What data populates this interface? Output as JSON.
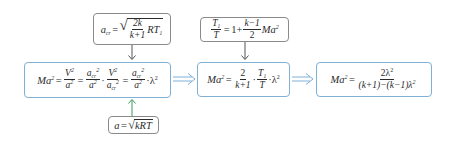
{
  "diagram": {
    "colors": {
      "main_border": "#7fb0d6",
      "side_border": "#8a8a8a",
      "down_arrow": "#555555",
      "up_arrow": "#3a9a5a",
      "implies_arrow": "#7fb0d6"
    },
    "nodes": {
      "acr_def": {
        "lhs": "a",
        "lhs_sub": "cr",
        "eq": "=",
        "sqrt_num": "2k",
        "sqrt_den": "k+1",
        "tail": "RT",
        "tail_sub": "1"
      },
      "temp_ratio": {
        "frac_num": "T",
        "frac_num_sub": "1",
        "frac_den": "T",
        "eq": "=",
        "rhs_a": "1+",
        "rhs_num": "k−1",
        "rhs_den": "2",
        "rhs_tail": "Ma",
        "rhs_tail_sup": "2"
      },
      "eq1": {
        "lhs": "Ma",
        "sup2": "2",
        "eq": "=",
        "f1_num": "V",
        "f1_den": "a",
        "f2_num": "a",
        "f2_num_sub": "cr",
        "f2_den": "a",
        "dot": "·",
        "f3_num": "V",
        "f3_den": "a",
        "f3_den_sub": "cr",
        "f4_num": "a",
        "f4_num_sub": "cr",
        "f4_den": "a",
        "lambda": "λ"
      },
      "eq2": {
        "lhs": "Ma",
        "sup2": "2",
        "eq": "=",
        "f1_num": "2",
        "f1_den": "k+1",
        "dot": "·",
        "f2_num": "T",
        "f2_num_sub": "1",
        "f2_den": "T",
        "lambda": "λ"
      },
      "eq3": {
        "lhs": "Ma",
        "sup2": "2",
        "eq": "=",
        "num": "2λ",
        "den": "(k+1)−(k−1)λ"
      },
      "sound_speed": {
        "lhs": "a",
        "eq": "=",
        "radicand": "kRT"
      }
    },
    "edges": [
      {
        "from": "acr_def",
        "to": "eq1",
        "type": "down-arrow"
      },
      {
        "from": "sound_speed",
        "to": "eq1",
        "type": "up-arrow"
      },
      {
        "from": "temp_ratio",
        "to": "eq2",
        "type": "down-arrow"
      },
      {
        "from": "eq1",
        "to": "eq2",
        "type": "implies"
      },
      {
        "from": "eq2",
        "to": "eq3",
        "type": "implies"
      }
    ]
  }
}
